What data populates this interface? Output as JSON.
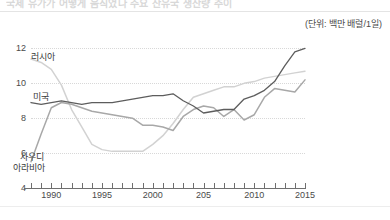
{
  "headline": {
    "text": "국제 유가가 어떻게 움직였나 주요 산유국 생산량 추이"
  },
  "unit_note": "(단위: 백만 배럴/1일)",
  "axes": {
    "y_ticks": [
      "12",
      "10",
      "8",
      "6",
      "4"
    ],
    "x_ticks": [
      "1990",
      "1995",
      "2000",
      "205",
      "2010",
      "2015"
    ]
  },
  "series_labels": {
    "russia": "러시아",
    "usa": "미국",
    "saudi_line1": "사우디",
    "saudi_line2": "아라비아"
  },
  "colors": {
    "usa": "#5d5d5d",
    "saudi": "#a8a8a8",
    "russia": "#d2d2d2",
    "axis": "#6f6f6f",
    "grid": "#d8d8d8"
  },
  "chart_data": {
    "type": "line",
    "title": "국제 유가가 어떻게 움직였나 주요 산유국 생산량 추이",
    "subtitle": "(단위: 백만 배럴/1일)",
    "xlabel": "",
    "ylabel": "백만 배럴/1일",
    "xlim": [
      1988,
      2015
    ],
    "ylim": [
      4,
      12.6
    ],
    "grid": true,
    "legend": "inline-labels",
    "x": [
      1988,
      1989,
      1990,
      1991,
      1992,
      1993,
      1994,
      1995,
      1996,
      1997,
      1998,
      1999,
      2000,
      2001,
      2002,
      2003,
      2004,
      2005,
      2006,
      2007,
      2008,
      2009,
      2010,
      2011,
      2012,
      2013,
      2014,
      2015
    ],
    "series": [
      {
        "name": "미국",
        "color": "#5d5d5d",
        "values": [
          8.9,
          8.8,
          8.9,
          9.0,
          8.9,
          8.8,
          8.9,
          8.9,
          8.9,
          9.0,
          9.1,
          9.2,
          9.3,
          9.3,
          9.4,
          9.0,
          8.7,
          8.3,
          8.4,
          8.5,
          8.5,
          9.1,
          9.3,
          9.6,
          10.1,
          11.0,
          11.8,
          12.0
        ]
      },
      {
        "name": "사우디아라비아",
        "color": "#a8a8a8",
        "values": [
          5.5,
          7.1,
          8.6,
          8.9,
          8.8,
          8.6,
          8.4,
          8.3,
          8.2,
          8.1,
          8.0,
          7.6,
          7.6,
          7.5,
          7.3,
          8.1,
          8.5,
          8.7,
          8.6,
          8.1,
          8.5,
          7.9,
          8.2,
          9.2,
          9.7,
          9.6,
          9.5,
          10.2
        ]
      },
      {
        "name": "러시아",
        "color": "#d2d2d2",
        "values": [
          11.4,
          11.2,
          10.8,
          9.9,
          8.5,
          7.5,
          6.5,
          6.2,
          6.1,
          6.1,
          6.1,
          6.1,
          6.5,
          7.0,
          7.7,
          8.5,
          9.2,
          9.4,
          9.6,
          9.8,
          9.8,
          10.0,
          10.1,
          10.3,
          10.4,
          10.5,
          10.6,
          10.7
        ]
      }
    ]
  }
}
